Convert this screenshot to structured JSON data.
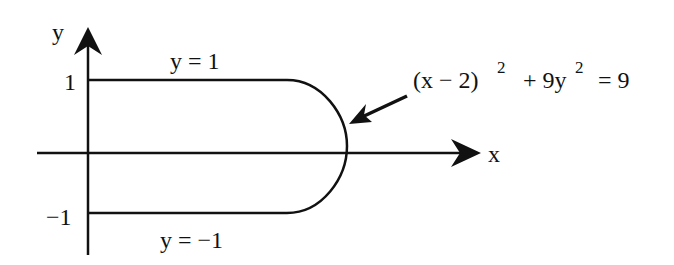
{
  "diagram": {
    "type": "region-plot",
    "axes": {
      "x_label": "x",
      "y_label": "y",
      "y_tick_top": "1",
      "y_tick_bottom": "−1"
    },
    "curves": {
      "top_line_label": "y = 1",
      "bottom_line_label": "y = −1",
      "ellipse_label_base": "(x − 2)",
      "ellipse_label_exp1": "2",
      "ellipse_label_mid": "+ 9y",
      "ellipse_label_exp2": "2",
      "ellipse_label_end": "= 9"
    },
    "colors": {
      "stroke": "#111111",
      "background": "#ffffff"
    }
  }
}
